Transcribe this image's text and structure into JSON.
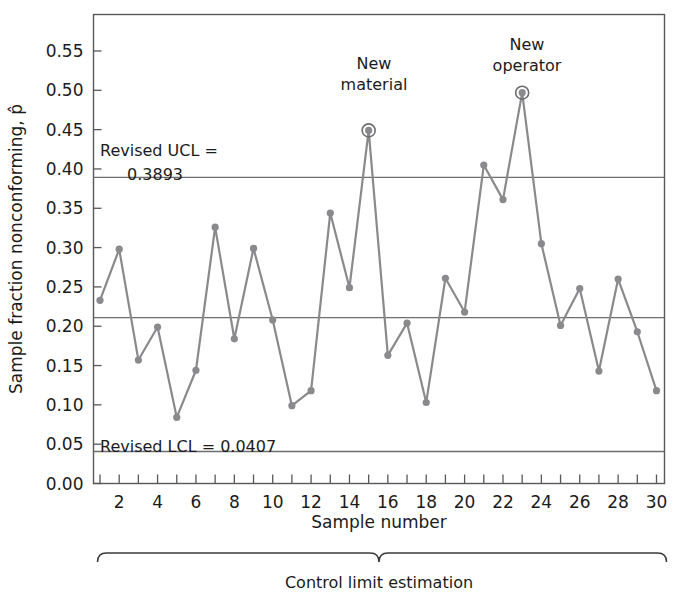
{
  "chart_data": {
    "type": "line",
    "title": "",
    "xlabel": "Sample number",
    "ylabel": "Sample fraction nonconforming, p̂",
    "xlim": [
      0,
      31
    ],
    "ylim": [
      0.0,
      0.58
    ],
    "grid": false,
    "legend_position": "none",
    "x": [
      1,
      2,
      3,
      4,
      5,
      6,
      7,
      8,
      9,
      10,
      11,
      12,
      13,
      14,
      15,
      16,
      17,
      18,
      19,
      20,
      21,
      22,
      23,
      24,
      25,
      26,
      27,
      28,
      29,
      30
    ],
    "values": [
      0.233,
      0.298,
      0.157,
      0.199,
      0.084,
      0.144,
      0.326,
      0.184,
      0.299,
      0.208,
      0.099,
      0.118,
      0.344,
      0.249,
      0.449,
      0.163,
      0.204,
      0.103,
      0.261,
      0.218,
      0.405,
      0.361,
      0.497,
      0.305,
      0.201,
      0.248,
      0.143,
      0.26,
      0.193,
      0.118
    ],
    "series": [
      {
        "name": "Sample fraction nonconforming",
        "values": [
          0.233,
          0.298,
          0.157,
          0.199,
          0.084,
          0.144,
          0.326,
          0.184,
          0.299,
          0.208,
          0.099,
          0.118,
          0.344,
          0.249,
          0.449,
          0.163,
          0.204,
          0.103,
          0.261,
          0.218,
          0.405,
          0.361,
          0.497,
          0.305,
          0.201,
          0.248,
          0.143,
          0.26,
          0.193,
          0.118
        ]
      }
    ],
    "ytick_labels": [
      "0.00",
      "0.05",
      "0.10",
      "0.15",
      "0.20",
      "0.25",
      "0.30",
      "0.35",
      "0.40",
      "0.45",
      "0.50",
      "0.55"
    ],
    "ytick_values": [
      0.0,
      0.05,
      0.1,
      0.15,
      0.2,
      0.25,
      0.3,
      0.35,
      0.4,
      0.45,
      0.5,
      0.55
    ],
    "xtick_labels": [
      "2",
      "4",
      "6",
      "8",
      "10",
      "12",
      "14",
      "16",
      "18",
      "20",
      "22",
      "24",
      "26",
      "28",
      "30"
    ],
    "xtick_values": [
      2,
      4,
      6,
      8,
      10,
      12,
      14,
      16,
      18,
      20,
      22,
      24,
      26,
      28,
      30
    ],
    "xtick_minor_values": [
      1,
      3,
      5,
      7,
      9,
      11,
      13,
      15,
      17,
      19,
      21,
      23,
      25,
      27,
      29
    ],
    "control_limits": [
      {
        "name": "UCL",
        "label": "Revised UCL =",
        "label_line2": "0.3893",
        "value": 0.3893
      },
      {
        "name": "CL",
        "label": "",
        "label_line2": "",
        "value": 0.211
      },
      {
        "name": "LCL",
        "label": "Revised LCL = 0.0407",
        "label_line2": "",
        "value": 0.0407
      }
    ],
    "annotations": [
      {
        "id": "new-material",
        "line1": "New",
        "line2": "material",
        "x": 15,
        "y": 0.449
      },
      {
        "id": "new-operator",
        "line1": "New",
        "line2": "operator",
        "x": 23,
        "y": 0.497
      }
    ],
    "highlighted_points": [
      15,
      23
    ],
    "bracket_caption": "Control limit estimation",
    "colors": {
      "series": "#8a8a8c",
      "limit_line": "#6e6e70",
      "axis": "#58585a",
      "text": "#1b1b1b",
      "background": "#ffffff"
    }
  }
}
